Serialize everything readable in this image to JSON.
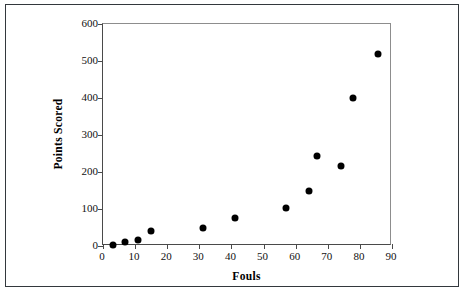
{
  "chart_data": {
    "type": "scatter",
    "title": "",
    "xlabel": "Fouls",
    "ylabel": "Points Scored",
    "xlim": [
      0,
      90
    ],
    "ylim": [
      0,
      600
    ],
    "xticks": [
      0,
      10,
      20,
      30,
      40,
      50,
      60,
      70,
      80,
      90
    ],
    "yticks": [
      0,
      100,
      200,
      300,
      400,
      500,
      600
    ],
    "grid": false,
    "legend": null,
    "marker": {
      "shape": "circle",
      "color": "#000000",
      "size": 7
    },
    "series": [
      {
        "name": "Fouls vs Points Scored",
        "points": [
          {
            "x": 3,
            "y": 2
          },
          {
            "x": 7,
            "y": 12
          },
          {
            "x": 11,
            "y": 17
          },
          {
            "x": 15,
            "y": 40
          },
          {
            "x": 31,
            "y": 50
          },
          {
            "x": 41,
            "y": 75
          },
          {
            "x": 57,
            "y": 103
          },
          {
            "x": 64,
            "y": 148
          },
          {
            "x": 66.5,
            "y": 243
          },
          {
            "x": 74,
            "y": 217
          },
          {
            "x": 78,
            "y": 400
          },
          {
            "x": 85.5,
            "y": 520
          }
        ]
      }
    ]
  },
  "axes": {
    "x_title": "Fouls",
    "y_title": "Points Scored",
    "x_tick_labels": [
      "0",
      "10",
      "20",
      "30",
      "40",
      "50",
      "60",
      "70",
      "80",
      "90"
    ],
    "y_tick_labels": [
      "0",
      "100",
      "200",
      "300",
      "400",
      "500",
      "600"
    ]
  },
  "colors": {
    "marker": "#000000",
    "frame": "#4a4a4a",
    "frame_light": "#8d8d8d",
    "outer_border": "#33383d",
    "background": "#ffffff",
    "text": "#000000"
  }
}
